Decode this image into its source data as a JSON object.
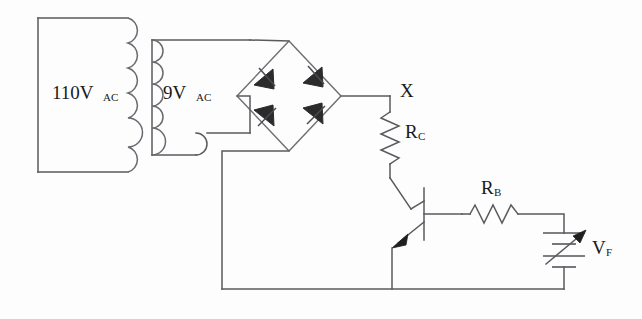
{
  "diagram": {
    "domain_type": "circuit-schematic",
    "background_color": "#fdfdfd",
    "wire_color": "#5a5a5f",
    "ink_color": "#1a1a1a"
  },
  "labels": {
    "primary_voltage": "110V",
    "primary_voltage_sub": "AC",
    "secondary_voltage": "9V",
    "secondary_voltage_sub": "AC",
    "node_x": "X",
    "collector_resistor": "R",
    "collector_resistor_sub": "C",
    "base_resistor": "R",
    "base_resistor_sub": "B",
    "source_voltage": "V",
    "source_voltage_sub": "F"
  },
  "components": [
    {
      "id": "transformer-primary",
      "type": "coil",
      "label": "110V AC",
      "turns": 6
    },
    {
      "id": "transformer-secondary",
      "type": "coil",
      "label": "9V AC",
      "turns": 6
    },
    {
      "id": "diode-bridge",
      "type": "bridge-rectifier",
      "diode_count": 4
    },
    {
      "id": "resistor-rc",
      "type": "resistor",
      "label": "R C",
      "orientation": "vertical"
    },
    {
      "id": "resistor-rb",
      "type": "resistor",
      "label": "R B",
      "orientation": "horizontal"
    },
    {
      "id": "transistor-q1",
      "type": "npn-transistor",
      "terminals": [
        "collector",
        "base",
        "emitter"
      ]
    },
    {
      "id": "source-vf",
      "type": "variable-dc-source",
      "label": "V F"
    },
    {
      "id": "node-x",
      "type": "node-label",
      "label": "X"
    }
  ]
}
